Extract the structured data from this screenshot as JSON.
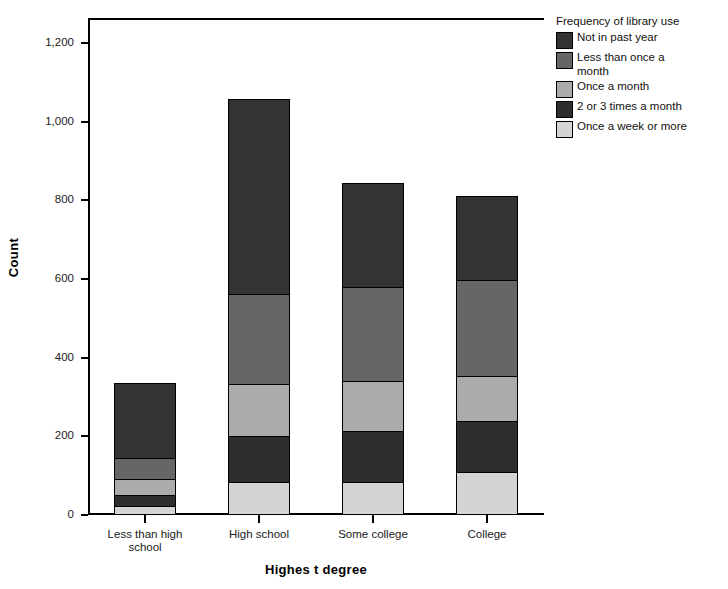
{
  "chart_data": {
    "type": "bar",
    "subtype": "stacked-bar",
    "title": "",
    "xlabel": "Highes t degree",
    "ylabel": "Count",
    "categories": [
      "Less than high school",
      "High school",
      "Some college",
      "College"
    ],
    "ylim": [
      0,
      1200
    ],
    "yticks": [
      0,
      200,
      400,
      600,
      800,
      1000,
      1200
    ],
    "ytick_labels": [
      "0",
      "200",
      "400",
      "600",
      "800",
      "1,000",
      "1,200"
    ],
    "grid": false,
    "legend_title": "Frequency of library use",
    "legend_position": "right",
    "stack_order_bottom_to_top": [
      "Once a week or more",
      "2 or 3 times a month",
      "Once a month",
      "Less than once a month",
      "Not in past year"
    ],
    "series": [
      {
        "name": "Not in past year",
        "color": "#333333",
        "values": [
          191,
          495,
          263,
          213
        ]
      },
      {
        "name": "Less than once a month",
        "color": "#666666",
        "values": [
          54,
          230,
          239,
          244
        ]
      },
      {
        "name": "Once a month",
        "color": "#ababab",
        "values": [
          40,
          132,
          127,
          115
        ]
      },
      {
        "name": "2 or 3 times a month",
        "color": "#2e2e2e",
        "values": [
          28,
          117,
          130,
          129
        ]
      },
      {
        "name": "Once a week or more",
        "color": "#d4d4d4",
        "values": [
          20,
          81,
          81,
          107
        ]
      }
    ],
    "totals": [
      333,
      1055,
      840,
      808
    ]
  },
  "legend": {
    "title": "Frequency of library use",
    "items": [
      {
        "label": "Not in past year",
        "color": "#333333"
      },
      {
        "label": "Less than once a month",
        "color": "#666666"
      },
      {
        "label": "Once a month",
        "color": "#ababab"
      },
      {
        "label": "2 or 3 times a month",
        "color": "#2e2e2e"
      },
      {
        "label": "Once a week or more",
        "color": "#d4d4d4"
      }
    ]
  },
  "axes": {
    "y_title": "Count",
    "x_title": "Highes t degree",
    "y_tick_labels": [
      "1,200",
      "1,000",
      "800",
      "600",
      "400",
      "200",
      "0"
    ],
    "x_tick_labels": [
      "Less than high school",
      "High school",
      "Some college",
      "College"
    ]
  }
}
